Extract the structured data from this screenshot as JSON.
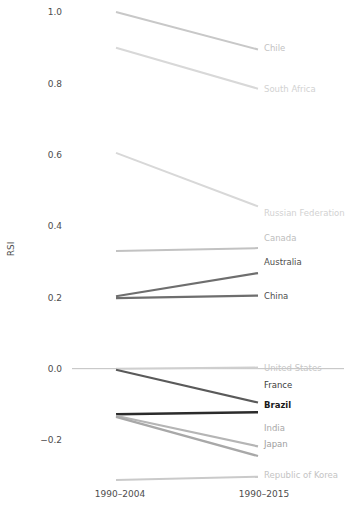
{
  "chart_data": {
    "type": "line",
    "title": "",
    "subtitle": "",
    "xlabel": "",
    "ylabel": "RSI",
    "x": [
      "1990–2004",
      "1990–2015"
    ],
    "categories": [
      "1990–2004",
      "1990–2015"
    ],
    "xtick_labels": [
      "1990–2004",
      "1990–2015"
    ],
    "ytick_labels": [
      "1.0",
      "0.8",
      "0.6",
      "0.4",
      "0.2",
      "0.0",
      "−0.2"
    ],
    "ytick_values": [
      1.0,
      0.8,
      0.6,
      0.4,
      0.2,
      0.0,
      -0.2
    ],
    "ylim": [
      -0.35,
      1.03
    ],
    "grid": false,
    "legend_position": "right-inline-labels",
    "zero_reference_line": 0.0,
    "series": [
      {
        "name": "Chile",
        "values": [
          1.0,
          0.895
        ],
        "color": "#c8c8c8",
        "width": 2.0,
        "label_color": "#c2c2c2",
        "label_weight": "normal"
      },
      {
        "name": "South Africa",
        "values": [
          0.9,
          0.785
        ],
        "color": "#d8d8d8",
        "width": 2.0,
        "label_color": "#d2d2d2",
        "label_weight": "normal"
      },
      {
        "name": "Russian Federation",
        "values": [
          0.605,
          0.455
        ],
        "color": "#d8d8d8",
        "width": 2.0,
        "label_color": "#d2d2d2",
        "label_weight": "normal"
      },
      {
        "name": "Canada",
        "values": [
          0.33,
          0.338
        ],
        "color": "#c2c2c2",
        "width": 2.0,
        "label_color": "#bdbdbd",
        "label_weight": "normal"
      },
      {
        "name": "Australia",
        "values": [
          0.203,
          0.268
        ],
        "color": "#6e6e6e",
        "width": 2.2,
        "label_color": "#4d4d4d",
        "label_weight": "normal"
      },
      {
        "name": "China",
        "values": [
          0.198,
          0.205
        ],
        "color": "#6e6e6e",
        "width": 2.2,
        "label_color": "#4d4d4d",
        "label_weight": "normal"
      },
      {
        "name": "United States",
        "values": [
          0.0,
          0.003
        ],
        "color": "#cfcfcf",
        "width": 2.0,
        "label_color": "#c7c7c7",
        "label_weight": "normal"
      },
      {
        "name": "France",
        "values": [
          -0.003,
          -0.095
        ],
        "color": "#5a5a5a",
        "width": 2.2,
        "label_color": "#3d3d3d",
        "label_weight": "normal"
      },
      {
        "name": "Brazil",
        "values": [
          -0.128,
          -0.122
        ],
        "color": "#2b2b2b",
        "width": 2.6,
        "label_color": "#1a1a1a",
        "label_weight": "bold"
      },
      {
        "name": "India",
        "values": [
          -0.132,
          -0.218
        ],
        "color": "#b5b5b5",
        "width": 2.2,
        "label_color": "#a8a8a8",
        "label_weight": "normal"
      },
      {
        "name": "Japan",
        "values": [
          -0.135,
          -0.245
        ],
        "color": "#a8a8a8",
        "width": 2.2,
        "label_color": "#9e9e9e",
        "label_weight": "normal"
      },
      {
        "name": "Republic of Korea",
        "values": [
          -0.312,
          -0.303
        ],
        "color": "#cacaca",
        "width": 2.0,
        "label_color": "#c4c4c4",
        "label_weight": "normal"
      }
    ]
  },
  "axis": {
    "y_title": "RSI"
  },
  "colors": {
    "background": "#ffffff",
    "tick_text": "#4d4d4d",
    "zero_line": "#bfbfbf"
  }
}
